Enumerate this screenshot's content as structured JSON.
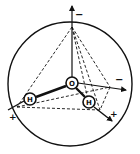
{
  "diagram": {
    "colors": {
      "ink": "#111111",
      "background": "#ffffff"
    },
    "atoms": [
      {
        "id": "oxygen",
        "label": "O"
      },
      {
        "id": "hydrogen-left",
        "label": "H"
      },
      {
        "id": "hydrogen-right",
        "label": "H"
      }
    ],
    "charges": [
      {
        "id": "charge-top",
        "label": "−"
      },
      {
        "id": "charge-right",
        "label": "−"
      },
      {
        "id": "charge-left",
        "label": "+"
      },
      {
        "id": "charge-bottom-right",
        "label": "+"
      }
    ]
  }
}
